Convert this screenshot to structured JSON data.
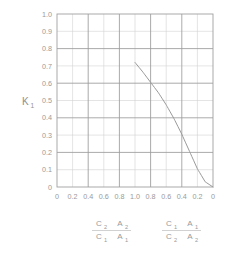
{
  "chart_data": {
    "type": "line",
    "title": "",
    "ylabel": "K",
    "ylabel_sub": "1",
    "xlabel": "",
    "ylim": [
      0,
      1.0
    ],
    "grid": true,
    "legend_position": "below-axis",
    "y_ticks": [
      "1.0",
      "0.9",
      "0.8",
      "0.7",
      "0.6",
      "0.5",
      "0.4",
      "0.3",
      "0.2",
      "0.1",
      "0"
    ],
    "y_tick_values": [
      1.0,
      0.9,
      0.8,
      0.7,
      0.6,
      0.5,
      0.4,
      0.3,
      0.2,
      0.1,
      0
    ],
    "x_ticks": [
      "0",
      "0.2",
      "0.4",
      "0.6",
      "0.8",
      "1.0",
      "0.8",
      "0.6",
      "0.4",
      "0.2",
      "0"
    ],
    "x_tick_values": [
      0,
      0.2,
      0.4,
      0.6,
      0.8,
      1.0,
      0.8,
      0.6,
      0.4,
      0.2,
      0
    ],
    "x_axis_note": "mirrored dual reciprocal-ratio scale: left half ascends 0 to 1.0, right half descends 1.0 to 0",
    "x_position": [
      0.0,
      0.1,
      0.2,
      0.3,
      0.4,
      0.5,
      0.6,
      0.7,
      0.8,
      0.9,
      1.0
    ],
    "series": [
      {
        "name": "K1",
        "x": [
          0.5,
          0.55,
          0.6,
          0.65,
          0.7,
          0.75,
          0.8,
          0.85,
          0.9,
          0.95,
          1.0
        ],
        "values": [
          0.72,
          0.665,
          0.605,
          0.545,
          0.475,
          0.395,
          0.305,
          0.205,
          0.105,
          0.03,
          0.0
        ],
        "x_labels": [
          "0.6",
          "0.7",
          "0.8",
          "0.9",
          "1.0",
          "0.9",
          "0.8",
          "0.7",
          "0.6",
          "0.4",
          "0"
        ],
        "color": "#9a9a9a"
      }
    ],
    "annotations": [],
    "axis_captions": [
      {
        "id": "left-ratio-caption",
        "numerator_1": "C",
        "numerator_1_sub": "2",
        "numerator_2": "A",
        "numerator_2_sub": "2",
        "denominator_1": "C",
        "denominator_1_sub": "1",
        "denominator_2": "A",
        "denominator_2_sub": "1"
      },
      {
        "id": "right-ratio-caption",
        "numerator_1": "C",
        "numerator_1_sub": "1",
        "numerator_2": "A",
        "numerator_2_sub": "1",
        "denominator_1": "C",
        "denominator_1_sub": "2",
        "denominator_2": "A",
        "denominator_2_sub": "2"
      }
    ],
    "colors": {
      "curve": "#9a9a9a",
      "grid_major": "#9b9b9b",
      "grid_minor": "#d2d2d2",
      "frame": "#a0a0a0",
      "text": "#9a9a9a",
      "background": "#ffffff"
    }
  }
}
